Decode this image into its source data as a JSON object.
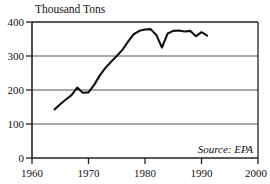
{
  "chart_data": {
    "type": "line",
    "title": "Thousand Tons",
    "xlabel": "",
    "ylabel": "Thousand Tons",
    "annotation": "Source: EPA",
    "grid": "horizontal",
    "legend": "none",
    "xlim": [
      1960,
      2000
    ],
    "ylim": [
      0,
      400
    ],
    "xticks": [
      1960,
      1970,
      1980,
      1990,
      2000
    ],
    "xtick_labels": [
      "1960",
      "1970",
      "1980",
      "1990",
      "2000"
    ],
    "yticks": [
      0,
      100,
      200,
      300,
      400
    ],
    "ytick_labels": [
      "0",
      "100",
      "200",
      "300",
      "400"
    ],
    "series": [
      {
        "name": "Thousand Tons",
        "x": [
          1964,
          1965,
          1966,
          1967,
          1968,
          1969,
          1970,
          1971,
          1972,
          1973,
          1974,
          1975,
          1976,
          1977,
          1978,
          1979,
          1980,
          1981,
          1982,
          1983,
          1984,
          1985,
          1986,
          1987,
          1988,
          1989,
          1990,
          1991
        ],
        "values": [
          143,
          158,
          172,
          185,
          207,
          192,
          193,
          215,
          243,
          265,
          283,
          300,
          318,
          342,
          364,
          374,
          378,
          379,
          362,
          325,
          366,
          374,
          375,
          372,
          374,
          358,
          370,
          360
        ]
      }
    ]
  },
  "axis": {
    "y_title": "Thousand Tons",
    "source": "Source: EPA"
  }
}
